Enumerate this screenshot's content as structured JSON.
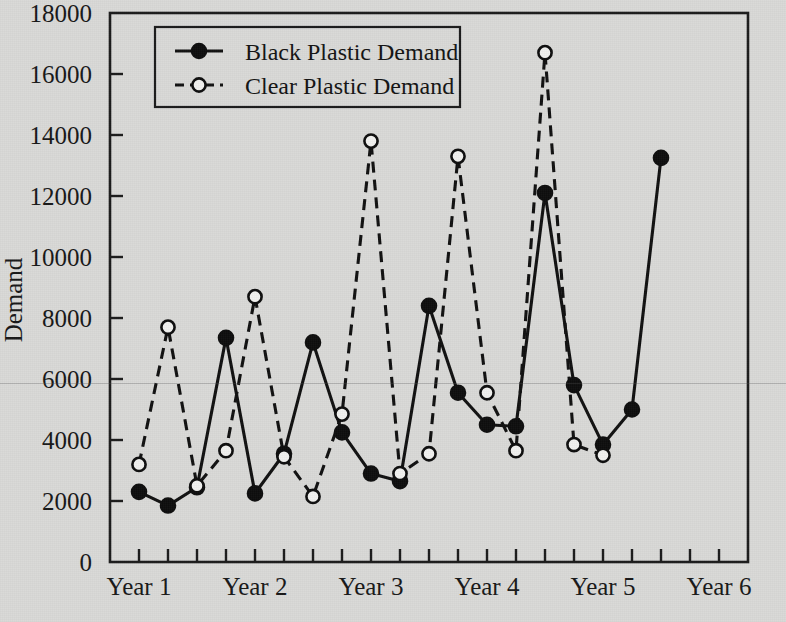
{
  "chart_data": {
    "type": "line",
    "title": "",
    "xlabel": "",
    "ylabel": "Demand",
    "ylim": [
      0,
      18000
    ],
    "ytick_labels": [
      "0",
      "2000",
      "4000",
      "6000",
      "8000",
      "10000",
      "12000",
      "14000",
      "16000",
      "18000"
    ],
    "ytick_values": [
      0,
      2000,
      4000,
      6000,
      8000,
      10000,
      12000,
      14000,
      16000,
      18000
    ],
    "xtick_labels": [
      "Year 1",
      "Year 2",
      "Year 3",
      "Year 4",
      "Year 5",
      "Year 6"
    ],
    "x_category_positions": [
      1,
      5,
      9,
      13,
      17,
      21
    ],
    "x_minor_tick_count": 21,
    "grid": false,
    "legend_position": "top-left-inside",
    "x": [
      1,
      2,
      3,
      4,
      5,
      6,
      7,
      8,
      9,
      10,
      11,
      12,
      13,
      14,
      15,
      16,
      17,
      18,
      19,
      20
    ],
    "series": [
      {
        "name": "Black Plastic Demand",
        "marker": "filled-circle",
        "line_style": "solid",
        "color": "#0d0d0d",
        "values": [
          2300,
          1850,
          2450,
          7350,
          2250,
          3550,
          7200,
          4250,
          2900,
          2650,
          8400,
          5550,
          4500,
          4450,
          12100,
          5800,
          3850,
          5000,
          13250,
          13250
        ]
      },
      {
        "name": "Clear Plastic Demand",
        "marker": "open-circle",
        "line_style": "dashed",
        "color": "#0d0d0d",
        "values": [
          3200,
          7700,
          2500,
          3650,
          8700,
          3450,
          2150,
          4850,
          13800,
          2900,
          3550,
          13300,
          5550,
          3650,
          16700,
          3500,
          3500,
          3500,
          3500,
          3500
        ]
      }
    ],
    "series_points": {
      "black": [
        {
          "x": 1,
          "y": 2300
        },
        {
          "x": 2,
          "y": 1850
        },
        {
          "x": 3,
          "y": 2450
        },
        {
          "x": 4,
          "y": 7350
        },
        {
          "x": 5,
          "y": 2250
        },
        {
          "x": 6,
          "y": 3550
        },
        {
          "x": 7,
          "y": 7200
        },
        {
          "x": 8,
          "y": 4250
        },
        {
          "x": 9,
          "y": 2900
        },
        {
          "x": 10,
          "y": 2650
        },
        {
          "x": 11,
          "y": 8400
        },
        {
          "x": 12,
          "y": 5550
        },
        {
          "x": 13,
          "y": 4500
        },
        {
          "x": 14,
          "y": 4450
        },
        {
          "x": 15,
          "y": 12100
        },
        {
          "x": 16,
          "y": 5800
        },
        {
          "x": 17,
          "y": 3850
        },
        {
          "x": 18,
          "y": 5000
        },
        {
          "x": 19,
          "y": 13250
        }
      ],
      "clear": [
        {
          "x": 1,
          "y": 3200
        },
        {
          "x": 2,
          "y": 7700
        },
        {
          "x": 3,
          "y": 2500
        },
        {
          "x": 4,
          "y": 3650
        },
        {
          "x": 5,
          "y": 8700
        },
        {
          "x": 6,
          "y": 3450
        },
        {
          "x": 7,
          "y": 2150
        },
        {
          "x": 8,
          "y": 4850
        },
        {
          "x": 9,
          "y": 13800
        },
        {
          "x": 10,
          "y": 2900
        },
        {
          "x": 11,
          "y": 3550
        },
        {
          "x": 12,
          "y": 13300
        },
        {
          "x": 13,
          "y": 5550
        },
        {
          "x": 14,
          "y": 3650
        },
        {
          "x": 15,
          "y": 16700
        },
        {
          "x": 16,
          "y": 3850
        },
        {
          "x": 17,
          "y": 3500
        }
      ]
    },
    "legend_entries": [
      {
        "label": "Black Plastic Demand",
        "marker": "filled-circle",
        "line_style": "solid"
      },
      {
        "label": "Clear Plastic Demand",
        "marker": "open-circle",
        "line_style": "dashed"
      }
    ]
  },
  "axis": {
    "y_title": "Demand"
  }
}
